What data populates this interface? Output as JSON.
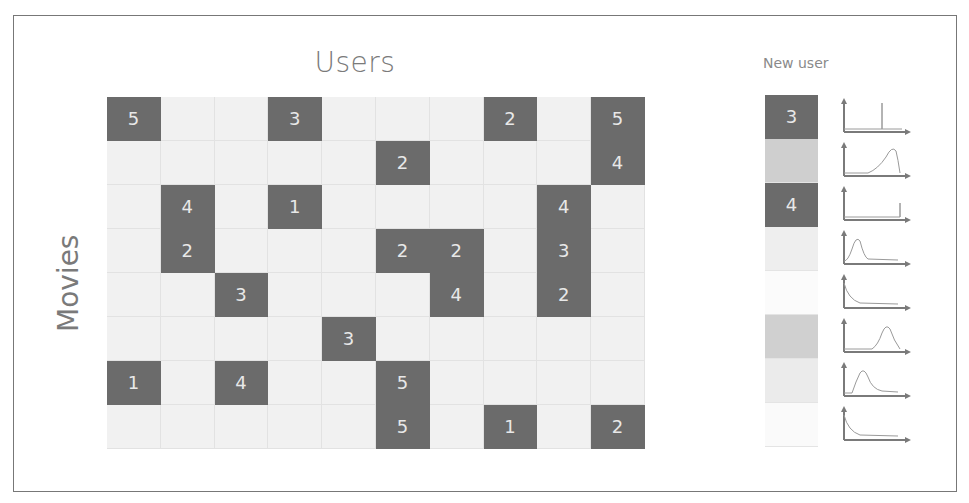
{
  "titles": {
    "users": "Users",
    "movies": "Movies",
    "new_user": "New user"
  },
  "colors": {
    "filled": "#6b6b6b",
    "empty": "#f1f1f1",
    "text_on_filled": "#e8e8e8",
    "label": "#7a7a7a",
    "frame": "#777777"
  },
  "matrix": {
    "rows": 8,
    "cols": 10,
    "cells": [
      [
        "5",
        "",
        "",
        "3",
        "",
        "",
        "",
        "2",
        "",
        "5"
      ],
      [
        "",
        "",
        "",
        "",
        "",
        "2",
        "",
        "",
        "",
        "4"
      ],
      [
        "",
        "4",
        "",
        "1",
        "",
        "",
        "",
        "",
        "4",
        ""
      ],
      [
        "",
        "2",
        "",
        "",
        "",
        "2",
        "2",
        "",
        "3",
        ""
      ],
      [
        "",
        "",
        "3",
        "",
        "",
        "",
        "4",
        "",
        "2",
        ""
      ],
      [
        "",
        "",
        "",
        "",
        "3",
        "",
        "",
        "",
        "",
        ""
      ],
      [
        "1",
        "",
        "4",
        "",
        "",
        "5",
        "",
        "",
        "",
        ""
      ],
      [
        "",
        "",
        "",
        "",
        "",
        "5",
        "",
        "1",
        "",
        "2"
      ]
    ]
  },
  "new_user": {
    "cells": [
      {
        "value": "3",
        "shade": "#6b6b6b",
        "dist": "spike-mid"
      },
      {
        "value": "",
        "shade": "#cfcfcf",
        "dist": "peak-right"
      },
      {
        "value": "4",
        "shade": "#6b6b6b",
        "dist": "spike-right"
      },
      {
        "value": "",
        "shade": "#eeeeee",
        "dist": "peak-left"
      },
      {
        "value": "",
        "shade": "#fbfbfb",
        "dist": "decay-left"
      },
      {
        "value": "",
        "shade": "#d0d0d0",
        "dist": "peak-center-right"
      },
      {
        "value": "",
        "shade": "#ebebeb",
        "dist": "peak-left-center"
      },
      {
        "value": "",
        "shade": "#fafafa",
        "dist": "decay-left"
      }
    ]
  }
}
